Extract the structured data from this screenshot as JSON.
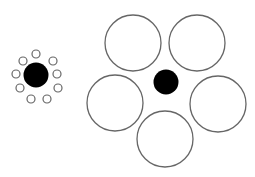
{
  "figure": {
    "colors": {
      "background": "#ffffff",
      "disc": "#000000",
      "ring_stroke": "#666666"
    },
    "left_group": {
      "center_disc": {
        "cx": 36,
        "cy": 75,
        "r": 12.5
      },
      "surround_radius": 4,
      "surrounds": [
        {
          "cx": 36,
          "cy": 54
        },
        {
          "cx": 23,
          "cy": 61
        },
        {
          "cx": 53,
          "cy": 61
        },
        {
          "cx": 16,
          "cy": 74
        },
        {
          "cx": 57,
          "cy": 74
        },
        {
          "cx": 20,
          "cy": 88
        },
        {
          "cx": 58,
          "cy": 88
        },
        {
          "cx": 31,
          "cy": 99
        },
        {
          "cx": 47,
          "cy": 99
        }
      ]
    },
    "right_group": {
      "center_disc": {
        "cx": 166,
        "cy": 82,
        "r": 12.5
      },
      "surround_radius": 28,
      "surrounds": [
        {
          "cx": 133,
          "cy": 43
        },
        {
          "cx": 197,
          "cy": 43
        },
        {
          "cx": 115,
          "cy": 103
        },
        {
          "cx": 218,
          "cy": 104
        },
        {
          "cx": 165,
          "cy": 139
        }
      ]
    }
  }
}
